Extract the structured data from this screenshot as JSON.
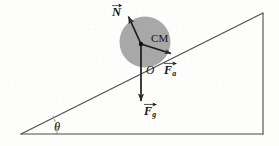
{
  "figure": {
    "background_color": "#fdfdfc",
    "stroke_color": "#2b2b2b",
    "body_fill_color": "#a8a8a8",
    "labels": {
      "normal_force": "N",
      "center_of_mass": "CM",
      "origin": "O",
      "applied_force_symbol": "F",
      "applied_force_subscript": "a",
      "gravity_force_symbol": "F",
      "gravity_force_subscript": "g",
      "incline_angle": "θ"
    },
    "geometry": {
      "incline_left_vertex": [
        21,
        134
      ],
      "incline_apex": [
        263,
        13
      ],
      "incline_right_base": [
        263,
        133
      ],
      "body_center": [
        145,
        42
      ],
      "body_radius": 25,
      "contact_point": [
        141,
        44
      ],
      "normal_arrow_tip": [
        129,
        16
      ],
      "applied_arrow_tip": [
        172,
        54
      ],
      "gravity_arrow_tip": [
        141,
        102
      ],
      "angle_arc_radius": 36
    }
  }
}
